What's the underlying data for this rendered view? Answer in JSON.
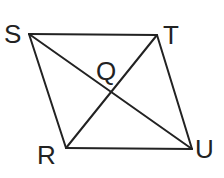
{
  "diagram": {
    "type": "parallelogram-with-diagonals",
    "stroke_color": "#222222",
    "background": "#ffffff",
    "vertices": {
      "S": {
        "label": "S",
        "x": 29,
        "y": 34
      },
      "T": {
        "label": "T",
        "x": 157,
        "y": 35
      },
      "U": {
        "label": "U",
        "x": 192,
        "y": 149
      },
      "R": {
        "label": "R",
        "x": 66,
        "y": 148
      }
    },
    "intersection": {
      "label": "Q",
      "x": 111,
      "y": 95
    },
    "sides": [
      "ST",
      "TU",
      "UR",
      "RS"
    ],
    "diagonals": [
      "SU",
      "TR"
    ]
  }
}
